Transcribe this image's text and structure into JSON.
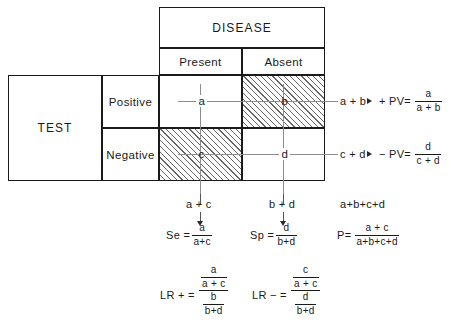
{
  "figure": {
    "type": "diagram"
  },
  "table": {
    "row_group_label": "TEST",
    "column_group_label": "DISEASE",
    "column_headers": [
      "Present",
      "Absent"
    ],
    "row_headers": [
      "Positive",
      "Negative"
    ],
    "cells": [
      {
        "id": "a",
        "label": "a",
        "row": "Positive",
        "column": "Present",
        "shaded": false
      },
      {
        "id": "b",
        "label": "b",
        "row": "Positive",
        "column": "Absent",
        "shaded": true
      },
      {
        "id": "c",
        "label": "c",
        "row": "Negative",
        "column": "Present",
        "shaded": true
      },
      {
        "id": "d",
        "label": "d",
        "row": "Negative",
        "column": "Absent",
        "shaded": false
      }
    ]
  },
  "row_totals": [
    {
      "sum": "a + b",
      "index_name": "+ PV=",
      "numerator": "a",
      "denominator": "a + b"
    },
    {
      "sum": "c + d",
      "index_name": "− PV=",
      "numerator": "d",
      "denominator": "c + d"
    }
  ],
  "column_totals": [
    {
      "sum": "a + c",
      "index_name": "Se =",
      "numerator": "a",
      "denominator": "a+c"
    },
    {
      "sum": "b + d",
      "index_name": "Sp =",
      "numerator": "d",
      "denominator": "b+d"
    }
  ],
  "grand_total": {
    "sum": "a+b+c+d",
    "index_name": "P=",
    "numerator": "a + c",
    "denominator": "a+b+c+d"
  },
  "likelihood_ratios": [
    {
      "index_name": "LR + =",
      "numerator": {
        "num": "a",
        "den": "a + c"
      },
      "denominator": {
        "num": "b",
        "den": "b+d"
      }
    },
    {
      "index_name": "LR − =",
      "numerator": {
        "num": "c",
        "den": "a + c"
      },
      "denominator": {
        "num": "d",
        "den": "b+d"
      }
    }
  ],
  "icons": {
    "arrow_down": "arrow-down-icon",
    "arrow_right": "arrow-right-icon"
  },
  "colors": {
    "ink": "#1a1a1a",
    "guide": "#8d8d8d",
    "hatch": "#4a4a4a",
    "background": "#ffffff"
  }
}
